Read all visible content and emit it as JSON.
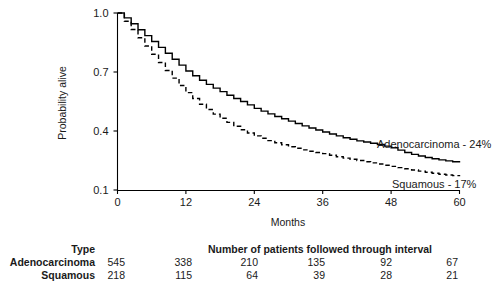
{
  "chart_data": {
    "type": "line",
    "title": "",
    "xlabel": "Months",
    "ylabel": "Probability alive",
    "xlim": [
      0,
      60
    ],
    "ylim": [
      0.1,
      1.0
    ],
    "xticks": [
      0,
      12,
      24,
      36,
      48,
      60
    ],
    "xticklabels": [
      "0",
      "12",
      "24",
      "36",
      "48",
      "60"
    ],
    "yticks": [
      0.1,
      0.4,
      0.7,
      1.0
    ],
    "yticklabels": [
      "0.1",
      "0.4",
      "0.7",
      "1.0"
    ],
    "grid": false,
    "legend_position": "inline-annotation",
    "step_style": "kaplan-meier step function",
    "series": [
      {
        "name": "Adenocarcinoma",
        "style": "solid",
        "annotation": "Adenocarcinoma - 24%",
        "final_survival_pct": "24%",
        "x": [
          0,
          1,
          2,
          3,
          4,
          5,
          6,
          7,
          8,
          9,
          10,
          11,
          12,
          14,
          16,
          18,
          20,
          22,
          24,
          27,
          30,
          33,
          36,
          39,
          42,
          45,
          48,
          51,
          54,
          57,
          60
        ],
        "y": [
          1.0,
          0.98,
          0.955,
          0.93,
          0.905,
          0.88,
          0.855,
          0.83,
          0.805,
          0.78,
          0.755,
          0.73,
          0.705,
          0.665,
          0.63,
          0.6,
          0.57,
          0.545,
          0.515,
          0.48,
          0.45,
          0.42,
          0.395,
          0.37,
          0.35,
          0.335,
          0.315,
          0.285,
          0.265,
          0.25,
          0.24
        ]
      },
      {
        "name": "Squamous",
        "style": "dashed",
        "annotation": "Squamous - 17%",
        "final_survival_pct": "17%",
        "x": [
          0,
          1,
          2,
          3,
          4,
          5,
          6,
          7,
          8,
          9,
          10,
          11,
          12,
          14,
          16,
          18,
          20,
          22,
          24,
          27,
          30,
          33,
          36,
          39,
          42,
          45,
          48,
          51,
          54,
          57,
          60
        ],
        "y": [
          1.0,
          0.965,
          0.93,
          0.895,
          0.86,
          0.825,
          0.79,
          0.755,
          0.72,
          0.69,
          0.655,
          0.625,
          0.595,
          0.545,
          0.5,
          0.465,
          0.43,
          0.4,
          0.375,
          0.345,
          0.32,
          0.3,
          0.285,
          0.265,
          0.25,
          0.235,
          0.22,
          0.205,
          0.19,
          0.178,
          0.17
        ]
      }
    ]
  },
  "risk_table": {
    "type_header": "Type",
    "counts_header": "Number of patients followed through interval",
    "rows": [
      {
        "label": "Adenocarcinoma",
        "values": [
          "545",
          "338",
          "210",
          "135",
          "92",
          "67"
        ]
      },
      {
        "label": "Squamous",
        "values": [
          "218",
          "115",
          "64",
          "39",
          "28",
          "21"
        ]
      }
    ]
  }
}
